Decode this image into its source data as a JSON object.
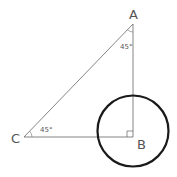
{
  "diagram": {
    "vertices": {
      "A": {
        "label": "A",
        "x": 133,
        "y": 24
      },
      "B": {
        "label": "B",
        "x": 133,
        "y": 137
      },
      "C": {
        "label": "C",
        "x": 24,
        "y": 137
      }
    },
    "angles": {
      "A": {
        "label": "45°"
      },
      "C": {
        "label": "45°"
      }
    },
    "circle": {
      "cx": 133,
      "cy": 131,
      "r": 36
    },
    "right_angle_at": "B",
    "colors": {
      "line": "#555555",
      "circle": "#1a1a1a",
      "text": "#555555"
    }
  }
}
